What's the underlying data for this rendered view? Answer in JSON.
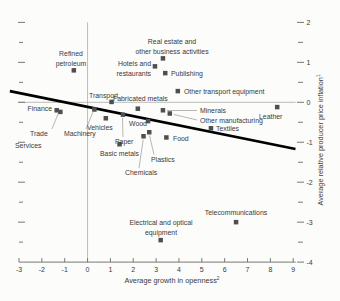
{
  "chart_data": {
    "type": "scatter",
    "title": "",
    "xlabel": {
      "text": "Average growth in openness",
      "sup": "2"
    },
    "ylabel": {
      "text": "Average relative producer price inflation",
      "sup": "1"
    },
    "xlim": [
      -3,
      9
    ],
    "ylim": [
      -4,
      2
    ],
    "x_ticks": [
      -3,
      -2,
      -1,
      0,
      1,
      2,
      3,
      4,
      5,
      6,
      7,
      8,
      9
    ],
    "y_major_ticks": [
      2,
      1,
      0,
      -1,
      -2,
      -3,
      -4
    ],
    "y_minor_ticks": [
      1.5,
      0.5,
      -0.5,
      -1.5,
      -2.5,
      -3.5
    ],
    "grid": {
      "zero_vertical_line": true,
      "zero_horizontal_line": true,
      "legend": "none"
    },
    "trend_line": {
      "x1": -3.4,
      "y1": 0.28,
      "x2": 9.1,
      "y2": -1.17
    },
    "layout": {
      "x_px": [
        19,
        293.2
      ],
      "y_px": [
        262.1,
        22.4
      ],
      "axis_y_px": 262.1,
      "marker_size": 4.5
    },
    "colors": {
      "marker": "#4f4f4f",
      "trend": "#000000",
      "axis": "#777777",
      "grid": "#ababab",
      "callout": "#999999",
      "text": "#3a3a3a"
    },
    "points": [
      {
        "name": "refined-petroleum",
        "x": -0.6,
        "y": 0.8,
        "label": {
          "lines": [
            "Refined",
            "petroleum"
          ],
          "anchor": "middle",
          "px": 71,
          "py": 56,
          "lh": 9.5
        }
      },
      {
        "name": "finance",
        "x": -1.35,
        "y": -0.2,
        "label": {
          "lines": [
            "Finance"
          ],
          "anchor": "end",
          "px": 52,
          "py": 111
        }
      },
      {
        "name": "trade",
        "x": -1.19,
        "y": -0.24,
        "label": {
          "lines": [
            "Trade"
          ],
          "anchor": "start",
          "px": 30,
          "py": 136
        },
        "callout": {
          "x1": 52,
          "y1": 129,
          "x2": 58,
          "y2": 114
        }
      },
      {
        "name": "services",
        "x": -1.19,
        "y": -0.24,
        "marker": false,
        "label": {
          "lines": [
            "Services"
          ],
          "anchor": "start",
          "px": 15,
          "py": 148
        }
      },
      {
        "name": "machinery",
        "x": 0.3,
        "y": -0.18,
        "label": {
          "lines": [
            "Machinery"
          ],
          "anchor": "start",
          "px": 64,
          "py": 136
        },
        "callout": {
          "x1": 86,
          "y1": 129,
          "x2": 93,
          "y2": 112
        }
      },
      {
        "name": "transport",
        "x": 1.05,
        "y": 0.01,
        "label": {
          "lines": [
            "Transport"
          ],
          "anchor": "start",
          "px": 89,
          "py": 98
        }
      },
      {
        "name": "vehicles",
        "x": 0.8,
        "y": -0.4,
        "label": {
          "lines": [
            "Vehicles"
          ],
          "anchor": "start",
          "px": 87,
          "py": 130
        }
      },
      {
        "name": "fabricated-metals",
        "x": 2.2,
        "y": -0.16,
        "label": {
          "lines": [
            "Fabricated metals"
          ],
          "anchor": "start",
          "px": 113,
          "py": 101
        }
      },
      {
        "name": "paper",
        "x": 1.55,
        "y": -0.31,
        "label": {
          "lines": [
            "Paper"
          ],
          "anchor": "start",
          "px": 115,
          "py": 144
        },
        "callout": {
          "x1": 123,
          "y1": 137,
          "x2": 122.5,
          "y2": 118
        }
      },
      {
        "name": "wood",
        "x": 2.65,
        "y": -0.47,
        "label": {
          "lines": [
            "Wood"
          ],
          "anchor": "start",
          "px": 129,
          "py": 126
        }
      },
      {
        "name": "basic-metals",
        "x": 1.4,
        "y": -1.05,
        "label": {
          "lines": [
            "Basic metals"
          ],
          "anchor": "start",
          "px": 100,
          "py": 156
        }
      },
      {
        "name": "chemicals",
        "x": 2.45,
        "y": -0.85,
        "label": {
          "lines": [
            "Chemicals"
          ],
          "anchor": "start",
          "px": 125,
          "py": 175
        },
        "callout": {
          "x1": 139,
          "y1": 168,
          "x2": 143.2,
          "y2": 139.5
        }
      },
      {
        "name": "plastics",
        "x": 2.7,
        "y": -0.75,
        "label": {
          "lines": [
            "Plastics"
          ],
          "anchor": "start",
          "px": 151,
          "py": 162
        },
        "callout": {
          "x1": 154,
          "y1": 154.5,
          "x2": 149.5,
          "y2": 135.5
        }
      },
      {
        "name": "food",
        "x": 3.45,
        "y": -0.88,
        "label": {
          "lines": [
            "Food"
          ],
          "anchor": "start",
          "px": 173,
          "py": 140.5
        }
      },
      {
        "name": "minerals",
        "x": 3.3,
        "y": -0.2,
        "label": {
          "lines": [
            "Minerals"
          ],
          "anchor": "start",
          "px": 200,
          "py": 113
        },
        "callout": {
          "x1": 197,
          "y1": 110.5,
          "x2": 167,
          "y2": 110.5
        }
      },
      {
        "name": "other-manufacturing",
        "x": 3.6,
        "y": -0.28,
        "label": {
          "lines": [
            "Other manufacturing"
          ],
          "anchor": "start",
          "px": 200,
          "py": 122.5
        },
        "callout": {
          "x1": 197,
          "y1": 120,
          "x2": 174,
          "y2": 114.5
        }
      },
      {
        "name": "textiles",
        "x": 5.4,
        "y": -0.65,
        "label": {
          "lines": [
            "Textiles"
          ],
          "anchor": "start",
          "px": 216,
          "py": 130.5
        }
      },
      {
        "name": "leather",
        "x": 8.3,
        "y": -0.12,
        "label": {
          "lines": [
            "Leather"
          ],
          "anchor": "start",
          "px": 259,
          "py": 118.5
        }
      },
      {
        "name": "real-estate-business-activities",
        "x": 3.3,
        "y": 1.1,
        "label": {
          "lines": [
            "Real estate and",
            "other business activities"
          ],
          "anchor": "middle",
          "px": 172,
          "py": 44,
          "lh": 9.5
        }
      },
      {
        "name": "hotels-restaurants",
        "x": 2.95,
        "y": 0.9,
        "label": {
          "lines": [
            "Hotels and",
            "restaurants"
          ],
          "anchor": "end",
          "px": 151,
          "py": 66,
          "lh": 9.5
        }
      },
      {
        "name": "publishing",
        "x": 3.4,
        "y": 0.73,
        "label": {
          "lines": [
            "Publishing"
          ],
          "anchor": "start",
          "px": 171,
          "py": 76
        }
      },
      {
        "name": "other-transport-equipment",
        "x": 3.95,
        "y": 0.28,
        "label": {
          "lines": [
            "Other transport equipment"
          ],
          "anchor": "start",
          "px": 184,
          "py": 94
        }
      },
      {
        "name": "telecommunications",
        "x": 6.5,
        "y": -3.0,
        "label": {
          "lines": [
            "Telecommunications"
          ],
          "anchor": "middle",
          "px": 236,
          "py": 215
        }
      },
      {
        "name": "electrical-optical-equipment",
        "x": 3.2,
        "y": -3.45,
        "label": {
          "lines": [
            "Electrical and optical",
            "equipment"
          ],
          "anchor": "middle",
          "px": 161,
          "py": 225,
          "lh": 9.5
        }
      }
    ]
  }
}
